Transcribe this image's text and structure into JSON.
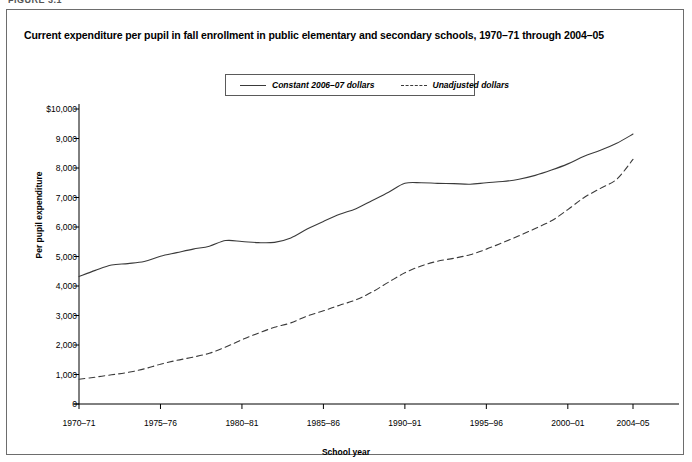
{
  "figure_tag": "FIGURE 3.1",
  "title": "Current expenditure per pupil in fall enrollment in public elementary and secondary schools, 1970–71 through 2004–05",
  "legend": {
    "items": [
      {
        "label": "Constant 2006–07 dollars",
        "style": "solid"
      },
      {
        "label": "Unadjusted dollars",
        "style": "dashed"
      }
    ]
  },
  "axes": {
    "ylabel": "Per pupil expenditure",
    "xlabel": "School year",
    "ytick_labels": [
      "$10,000",
      "9,000",
      "8,000",
      "7,000",
      "6,000",
      "5,000",
      "4,000",
      "3,000",
      "2,000",
      "1,000",
      "0"
    ],
    "xtick_labels": [
      "1970–71",
      "1975–76",
      "1980–81",
      "1985–86",
      "1990–91",
      "1995–96",
      "2000–01",
      "2004–05"
    ]
  },
  "colors": {
    "line": "#3a3a3a",
    "axis": "#000000",
    "frame": "#6d6d6d",
    "background": "#ffffff"
  },
  "chart_data": {
    "type": "line",
    "title": "Current expenditure per pupil in fall enrollment in public elementary and secondary schools, 1970–71 through 2004–05",
    "xlabel": "School year",
    "ylabel": "Per pupil expenditure",
    "ylim": [
      0,
      10000
    ],
    "ytick_values": [
      0,
      1000,
      2000,
      3000,
      4000,
      5000,
      6000,
      7000,
      8000,
      9000,
      10000
    ],
    "grid": false,
    "legend_position": "top-center",
    "x": [
      "1970–71",
      "1971–72",
      "1972–73",
      "1973–74",
      "1974–75",
      "1975–76",
      "1976–77",
      "1977–78",
      "1978–79",
      "1979–80",
      "1980–81",
      "1981–82",
      "1982–83",
      "1983–84",
      "1984–85",
      "1985–86",
      "1986–87",
      "1987–88",
      "1988–89",
      "1989–90",
      "1990–91",
      "1991–92",
      "1992–93",
      "1993–94",
      "1994–95",
      "1995–96",
      "1996–97",
      "1997–98",
      "1998–99",
      "1999–2000",
      "2000–01",
      "2001–02",
      "2002–03",
      "2003–04",
      "2004–05"
    ],
    "xtick_indices": [
      0,
      5,
      10,
      15,
      20,
      25,
      30,
      34
    ],
    "series": [
      {
        "name": "Constant 2006–07 dollars",
        "style": "solid",
        "values": [
          4320,
          4530,
          4710,
          4760,
          4830,
          5010,
          5130,
          5250,
          5350,
          5540,
          5510,
          5470,
          5480,
          5630,
          5930,
          6190,
          6430,
          6620,
          6900,
          7180,
          7480,
          7500,
          7480,
          7470,
          7450,
          7500,
          7540,
          7620,
          7750,
          7930,
          8140,
          8400,
          8600,
          8840,
          9150
        ]
      },
      {
        "name": "Unadjusted dollars",
        "style": "dashed",
        "values": [
          840,
          910,
          990,
          1070,
          1190,
          1350,
          1480,
          1590,
          1720,
          1930,
          2180,
          2400,
          2600,
          2750,
          2980,
          3160,
          3350,
          3530,
          3800,
          4130,
          4450,
          4680,
          4840,
          4940,
          5060,
          5250,
          5470,
          5700,
          5950,
          6210,
          6590,
          7000,
          7310,
          7620,
          8290
        ]
      }
    ]
  }
}
